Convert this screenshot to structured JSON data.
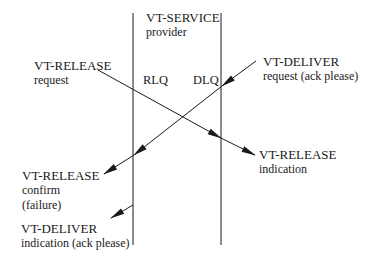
{
  "diagram": {
    "provider": {
      "title": "VT-SERVICE",
      "subtitle": "provider"
    },
    "queues": {
      "left": "RLQ",
      "right": "DLQ"
    },
    "labels": {
      "release_request": {
        "line1": "VT-RELEASE",
        "line2": "request"
      },
      "deliver_request": {
        "line1": "VT-DELIVER",
        "line2": "request (ack please)"
      },
      "release_indication": {
        "line1": "VT-RELEASE",
        "line2": "indication"
      },
      "release_confirm": {
        "line1": "VT-RELEASE",
        "line2": "confirm",
        "line3": "(failure)"
      },
      "deliver_indication": {
        "line1": "VT-DELIVER",
        "line2": "indication (ack please)"
      }
    },
    "colors": {
      "line": "#1a1a1a",
      "background": "#ffffff"
    }
  }
}
